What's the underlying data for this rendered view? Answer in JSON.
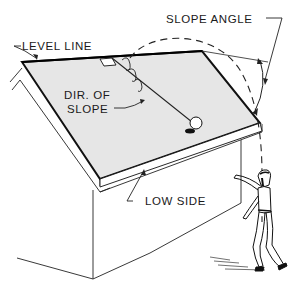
{
  "diagram": {
    "type": "technical-illustration",
    "labels": {
      "level_line": "LEVEL LINE",
      "slope_angle": "SLOPE ANGLE",
      "dir_of_slope_line1": "DIR. OF",
      "dir_of_slope_line2": "SLOPE",
      "low_side": "LOW SIDE"
    },
    "colors": {
      "roof_fill": "#e6e6e6",
      "line": "#111111",
      "background": "#ffffff"
    }
  }
}
